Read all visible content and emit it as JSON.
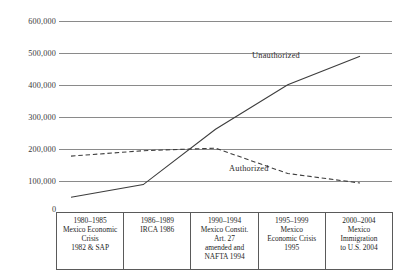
{
  "chart_data": {
    "type": "line",
    "title": "",
    "xlabel": "",
    "ylabel": "",
    "ylim": [
      0,
      600000
    ],
    "yticks": [
      "0",
      "100,000",
      "200,000",
      "300,000",
      "400,000",
      "500,000",
      "600,000"
    ],
    "ytick_values": [
      0,
      100000,
      200000,
      300000,
      400000,
      500000,
      600000
    ],
    "grid": true,
    "legend_position": "inline-labels",
    "categories": [
      "1980-1985",
      "1986-1989",
      "1990-1994",
      "1995-1999",
      "2000-2004"
    ],
    "series": [
      {
        "name": "Unauthorized",
        "style": "solid",
        "color": "#3d3d3d",
        "values": [
          45000,
          85000,
          260000,
          400000,
          490000
        ]
      },
      {
        "name": "Authorized",
        "style": "dashed",
        "color": "#3d3d3d",
        "values": [
          175000,
          192000,
          200000,
          120000,
          90000
        ]
      }
    ],
    "annotations": [
      {
        "text": "Unauthorized",
        "x": 252,
        "y": 57
      },
      {
        "text": "Authorized",
        "x": 229,
        "y": 171
      }
    ]
  },
  "axis": {
    "tick_600000": "600,000",
    "tick_500000": "500,000",
    "tick_400000": "400,000",
    "tick_300000": "300,000",
    "tick_200000": "200,000",
    "tick_100000": "100,000",
    "tick_0": "0"
  },
  "series_labels": {
    "unauthorized": "Unauthorized",
    "authorized": "Authorized"
  },
  "event_table": {
    "columns": [
      {
        "period": "1980-1985",
        "lines": [
          "1980–1985",
          "Mexico Economic",
          "Crisis",
          "1982 & SAP"
        ]
      },
      {
        "period": "1986-1989",
        "lines": [
          "1986–1989",
          "IRCA 1986"
        ]
      },
      {
        "period": "1990-1994",
        "lines": [
          "1990–1994",
          "Mexico Constit.",
          "Art. 27",
          "amended and",
          "NAFTA 1994"
        ]
      },
      {
        "period": "1995-1999",
        "lines": [
          "1995–1999",
          "Mexico",
          "Economic Crisis",
          "1995"
        ]
      },
      {
        "period": "2000-2004",
        "lines": [
          "2000–2004",
          "Mexico",
          "Immigration",
          "to U.S. 2004"
        ]
      }
    ]
  }
}
